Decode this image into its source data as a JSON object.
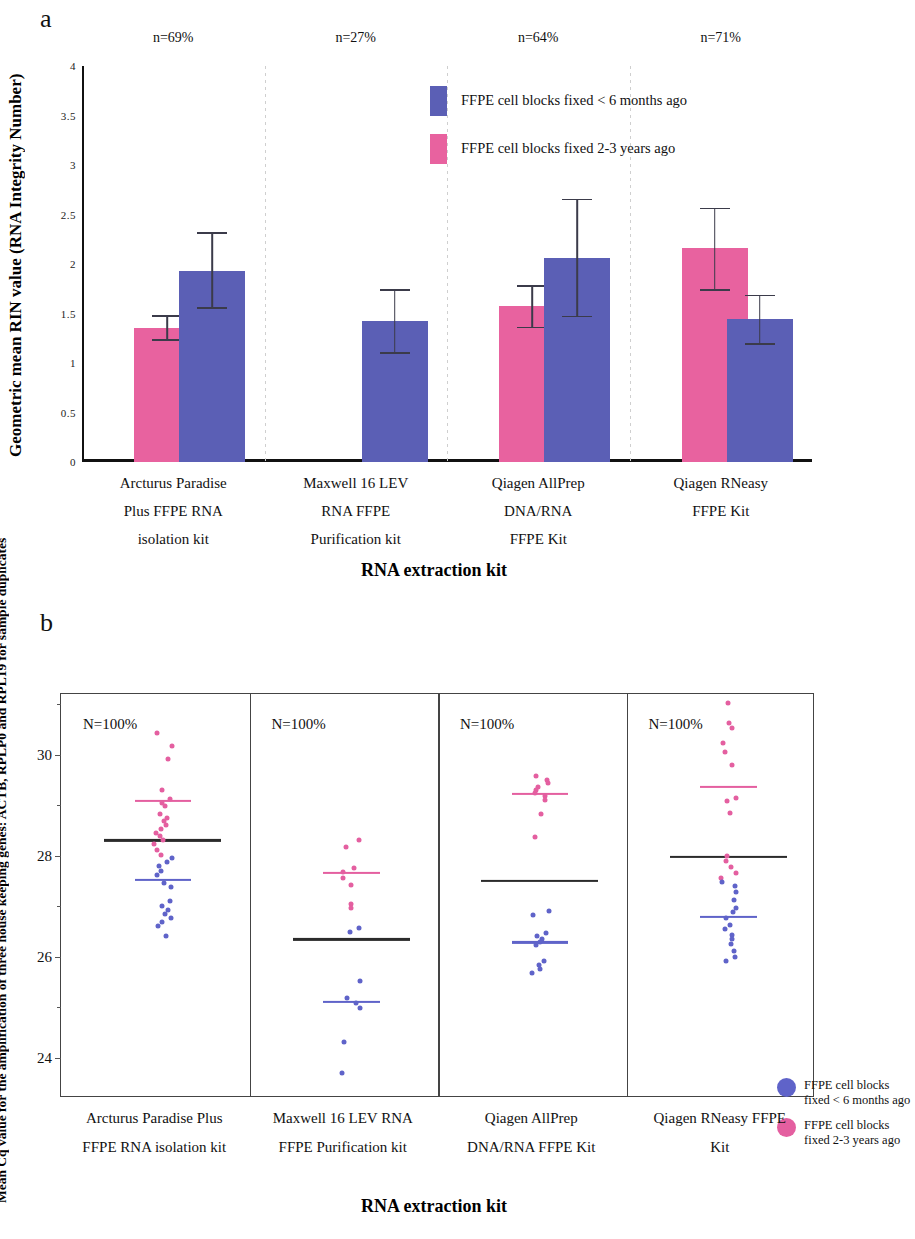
{
  "figure": {
    "panel_a_letter": "a",
    "panel_b_letter": "b"
  },
  "colors": {
    "blue": "#5b5fb5",
    "pink": "#e8629f",
    "pink_light": "#ee77ac",
    "blue_dot": "#5f63c9",
    "pink_dot": "#e45fa0",
    "black_mean": "#2b2b2b",
    "error_bar": "#3b3b4a",
    "axis": "#111111",
    "frame": "#444444"
  },
  "panel_a": {
    "y_axis_title": "Geometric mean RIN value (RNA Integrity Number)",
    "x_axis_title": "RNA extraction kit",
    "y_tick_labels": [
      "4",
      "3.5",
      "3",
      "2.5",
      "2",
      "1.5",
      "1",
      "0.5",
      "0"
    ],
    "legend": [
      {
        "color_key": "blue",
        "label": "FFPE cell blocks fixed < 6 months ago"
      },
      {
        "color_key": "pink",
        "label": "FFPE cell blocks fixed 2-3 years ago"
      }
    ],
    "group_n_labels": [
      "n=69%",
      "n=27%",
      "n=64%",
      "n=71%"
    ],
    "category_labels": [
      [
        "Arcturus Paradise",
        "Plus FFPE RNA",
        "isolation kit"
      ],
      [
        "Maxwell 16 LEV",
        "RNA FFPE",
        "Purification kit"
      ],
      [
        "Qiagen AllPrep",
        "DNA/RNA",
        "FFPE Kit"
      ],
      [
        "Qiagen RNeasy",
        "FFPE Kit"
      ]
    ]
  },
  "panel_b": {
    "y_axis_title": "Mean Cq value for the amplification of three house keeping genes: ACTB, RPLP0 and RPL19 for sample duplicates",
    "x_axis_title": "RNA extraction kit",
    "y_tick_labels": [
      "30",
      "28",
      "26",
      "24"
    ],
    "group_n_labels": [
      "N=100%",
      "N=100%",
      "N=100%",
      "N=100%"
    ],
    "legend": [
      {
        "color_key": "blue_dot",
        "label_line1": "FFPE cell blocks",
        "label_line2": "fixed < 6 months ago"
      },
      {
        "color_key": "pink_dot",
        "label_line1": "FFPE cell blocks",
        "label_line2": "fixed 2-3 years ago"
      }
    ],
    "category_labels": [
      [
        "Arcturus Paradise Plus",
        "FFPE RNA isolation kit"
      ],
      [
        "Maxwell 16 LEV RNA",
        "FFPE Purification kit"
      ],
      [
        "Qiagen AllPrep",
        "DNA/RNA FFPE Kit"
      ],
      [
        "Qiagen RNeasy FFPE",
        "Kit"
      ]
    ]
  },
  "chart_data": [
    {
      "type": "bar",
      "panel": "a",
      "title": "",
      "xlabel": "RNA extraction kit",
      "ylabel": "Geometric mean RIN value (RNA Integrity Number)",
      "ylim": [
        0,
        4
      ],
      "yticks": [
        0,
        0.5,
        1,
        1.5,
        2,
        2.5,
        3,
        3.5,
        4
      ],
      "grid": false,
      "legend_position": "inside-top-right",
      "categories": [
        "Arcturus Paradise Plus FFPE RNA isolation kit",
        "Maxwell 16 LEV RNA FFPE Purification kit",
        "Qiagen AllPrep DNA/RNA FFPE Kit",
        "Qiagen RNeasy FFPE Kit"
      ],
      "annotations": [
        "n=69%",
        "n=27%",
        "n=64%",
        "n=71%"
      ],
      "series": [
        {
          "name": "FFPE cell blocks fixed 2-3 years ago",
          "color_key": "pink",
          "values": [
            1.35,
            null,
            1.58,
            2.16
          ],
          "err_low": [
            1.22,
            null,
            1.35,
            1.73
          ],
          "err_high": [
            1.48,
            null,
            1.79,
            2.57
          ]
        },
        {
          "name": "FFPE cell blocks fixed < 6 months ago",
          "color_key": "blue",
          "values": [
            1.93,
            1.42,
            2.06,
            1.44
          ],
          "err_low": [
            1.55,
            1.09,
            1.46,
            1.18
          ],
          "err_high": [
            2.32,
            1.75,
            2.66,
            1.69
          ]
        }
      ]
    },
    {
      "type": "scatter",
      "panel": "b",
      "title": "",
      "xlabel": "RNA extraction kit",
      "ylabel": "Mean Cq value for the amplification of three house keeping genes: ACTB, RPLP0 and RPL19 for sample duplicates",
      "ylim": [
        23.2,
        31.2
      ],
      "yticks": [
        24,
        26,
        28,
        30
      ],
      "grid": false,
      "legend_position": "inside-bottom-right",
      "annotations": [
        "N=100%",
        "N=100%",
        "N=100%",
        "N=100%"
      ],
      "groups": [
        {
          "category": "Arcturus Paradise Plus FFPE RNA isolation kit",
          "mean_all": 28.3,
          "mean_pink": 29.08,
          "mean_blue": 27.52,
          "points_pink": [
            30.42,
            30.18,
            29.92,
            29.3,
            29.12,
            29.05,
            28.98,
            28.82,
            28.75,
            28.68,
            28.6,
            28.52,
            28.44,
            28.38,
            28.3,
            28.22,
            28.12,
            28.02
          ],
          "points_blue": [
            27.95,
            27.88,
            27.8,
            27.7,
            27.62,
            27.45,
            27.38,
            27.1,
            27.0,
            26.92,
            26.84,
            26.76,
            26.68,
            26.6,
            26.4
          ]
        },
        {
          "category": "Maxwell 16 LEV RNA FFPE Purification kit",
          "mean_all": 26.34,
          "mean_pink": 27.66,
          "mean_blue": 25.1,
          "points_pink": [
            28.3,
            28.18,
            27.76,
            27.68,
            27.55,
            27.42,
            27.05,
            26.96
          ],
          "points_blue": [
            26.56,
            26.48,
            25.52,
            25.18,
            25.08,
            24.98,
            24.3,
            23.7
          ]
        },
        {
          "category": "Qiagen AllPrep DNA/RNA FFPE Kit",
          "mean_all": 27.5,
          "mean_pink": 29.22,
          "mean_blue": 26.28,
          "points_pink": [
            29.58,
            29.5,
            29.44,
            29.36,
            29.3,
            29.24,
            29.18,
            29.1,
            28.82,
            28.36
          ],
          "points_blue": [
            26.9,
            26.82,
            26.46,
            26.4,
            26.34,
            26.28,
            26.22,
            25.92,
            25.84,
            25.76,
            25.68
          ]
        },
        {
          "category": "Qiagen RNeasy FFPE Kit",
          "mean_all": 27.98,
          "mean_pink": 29.36,
          "mean_blue": 26.78,
          "points_pink": [
            31.02,
            30.62,
            30.52,
            30.22,
            30.06,
            29.8,
            29.14,
            29.08,
            28.84,
            28.0,
            27.9,
            27.78,
            27.66,
            27.56
          ],
          "points_blue": [
            27.48,
            27.4,
            27.28,
            27.12,
            26.96,
            26.88,
            26.76,
            26.62,
            26.54,
            26.42,
            26.34,
            26.24,
            26.12,
            26.0,
            25.92
          ]
        }
      ]
    }
  ]
}
